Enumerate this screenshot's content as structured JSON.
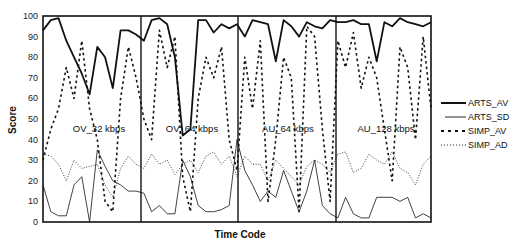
{
  "chart_data": {
    "type": "line",
    "title": "",
    "xlabel": "Time Code",
    "ylabel": "Score",
    "ylim": [
      0,
      100
    ],
    "yticks": [
      0,
      10,
      20,
      30,
      40,
      50,
      60,
      70,
      80,
      90,
      100
    ],
    "grid": false,
    "legend_position": "right",
    "segments": [
      {
        "label": "OV_32 kbps",
        "x_start": 0,
        "x_end": 25
      },
      {
        "label": "OV_64 kbps",
        "x_start": 25,
        "x_end": 50
      },
      {
        "label": "AU_64 kbps",
        "x_start": 50,
        "x_end": 75
      },
      {
        "label": "AU_128 kbps",
        "x_start": 75,
        "x_end": 100
      }
    ],
    "x": [
      0,
      2,
      4,
      6,
      8,
      10,
      12,
      14,
      16,
      18,
      20,
      22,
      24,
      26,
      28,
      30,
      32,
      34,
      36,
      38,
      40,
      42,
      44,
      46,
      48,
      50,
      52,
      54,
      56,
      58,
      60,
      62,
      64,
      66,
      68,
      70,
      72,
      74,
      76,
      78,
      80,
      82,
      84,
      86,
      88,
      90,
      92,
      94,
      96,
      98,
      100
    ],
    "series": [
      {
        "name": "ARTS_AV",
        "style": "solid-thick",
        "values": [
          93,
          98,
          99,
          88,
          80,
          72,
          62,
          85,
          80,
          65,
          93,
          93,
          91,
          88,
          98,
          99,
          96,
          80,
          42,
          45,
          98,
          98,
          92,
          96,
          94,
          96,
          90,
          98,
          97,
          96,
          78,
          98,
          95,
          90,
          97,
          95,
          94,
          98,
          97,
          97,
          98,
          96,
          96,
          78,
          97,
          95,
          99,
          97,
          96,
          95,
          97
        ]
      },
      {
        "name": "ARTS_SD",
        "style": "solid-thin",
        "values": [
          18,
          5,
          3,
          3,
          18,
          22,
          0,
          35,
          27,
          20,
          18,
          15,
          15,
          14,
          5,
          8,
          4,
          4,
          30,
          22,
          8,
          5,
          5,
          6,
          8,
          40,
          25,
          18,
          10,
          15,
          12,
          25,
          15,
          5,
          15,
          30,
          8,
          4,
          2,
          12,
          4,
          2,
          2,
          12,
          12,
          12,
          10,
          12,
          2,
          4,
          2
        ]
      },
      {
        "name": "SIMP_AV",
        "style": "dashed",
        "values": [
          30,
          45,
          55,
          75,
          60,
          88,
          55,
          40,
          10,
          5,
          60,
          85,
          70,
          50,
          40,
          93,
          75,
          90,
          22,
          5,
          60,
          80,
          70,
          85,
          40,
          25,
          80,
          55,
          88,
          10,
          40,
          80,
          70,
          5,
          95,
          90,
          45,
          10,
          88,
          75,
          92,
          65,
          80,
          70,
          45,
          20,
          85,
          75,
          40,
          90,
          55
        ]
      },
      {
        "name": "SIMP_AD",
        "style": "dotted",
        "values": [
          33,
          32,
          28,
          20,
          30,
          26,
          27,
          28,
          18,
          12,
          26,
          32,
          28,
          26,
          33,
          28,
          30,
          23,
          28,
          30,
          24,
          32,
          34,
          28,
          32,
          22,
          32,
          28,
          28,
          20,
          30,
          26,
          22,
          18,
          27,
          30,
          28,
          24,
          33,
          34,
          24,
          26,
          33,
          30,
          28,
          34,
          26,
          24,
          18,
          28,
          32
        ]
      }
    ]
  },
  "legend": {
    "items": [
      {
        "label": "ARTS_AV"
      },
      {
        "label": "ARTS_SD"
      },
      {
        "label": "SIMP_AV"
      },
      {
        "label": "SIMP_AD"
      }
    ]
  },
  "axes": {
    "ylabel": "Score",
    "xlabel": "Time Code",
    "yticks": [
      "0",
      "10",
      "20",
      "30",
      "40",
      "50",
      "60",
      "70",
      "80",
      "90",
      "100"
    ]
  },
  "segment_labels": [
    "OV_32 kbps",
    "OV_64 kbps",
    "AU_64 kbps",
    "AU_128 kbps"
  ]
}
